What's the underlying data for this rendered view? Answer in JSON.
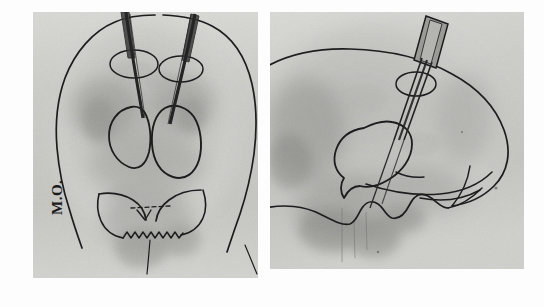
{
  "figure": {
    "kind": "radiograph-pair",
    "background_color": "#fdfdfd",
    "film_base_color": "#c9c9c6",
    "ink_color": "#1d1d1d",
    "electrode_color": "#242424"
  },
  "annotations": {
    "film_id": "M.O.",
    "side_marker": "L"
  },
  "panels": [
    {
      "id": "panel-ap",
      "name": "ap-coronal-radiograph",
      "projection": "anteroposterior",
      "x": 33,
      "y": 12,
      "width": 225,
      "height": 266,
      "drawn_structures": [
        "skull-outline",
        "left-burr-hole-circle",
        "right-burr-hole-circle",
        "left-target-nucleus-outline",
        "right-target-nucleus-outline",
        "skull-base-petrous-ridge",
        "sella-serrated-line",
        "midline-reference"
      ],
      "electrode_count": 2
    },
    {
      "id": "panel-lateral",
      "name": "lateral-radiograph",
      "projection": "lateral",
      "x": 270,
      "y": 12,
      "width": 254,
      "height": 257,
      "drawn_structures": [
        "calvarium-outline",
        "burr-hole-circle",
        "ventricle-target-outline",
        "skull-base-contour",
        "sella-turcica-contour",
        "posterior-fossa-line"
      ],
      "electrode_count": 1,
      "electrode_holder": "guide-cannula"
    }
  ],
  "chart_data": {
    "type": "scatter",
    "xlabel": "",
    "ylabel": "",
    "series": [
      {
        "name": "ap-electrode-trajectories",
        "values": [
          {
            "entry_x": 123,
            "entry_y": 15,
            "tip_x": 131,
            "tip_y": 117
          },
          {
            "entry_x": 173,
            "entry_y": 22,
            "tip_x": 156,
            "tip_y": 119
          }
        ]
      },
      {
        "name": "lateral-electrode-trajectory",
        "values": [
          {
            "entry_x": 433,
            "entry_y": 28,
            "tip_x": 399,
            "tip_y": 125
          }
        ]
      }
    ]
  }
}
